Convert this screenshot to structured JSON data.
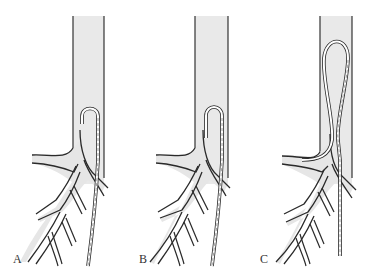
{
  "figure": {
    "colors": {
      "vessel_fill": "#e8e8e8",
      "outline": "#2a2a2a",
      "background": "#ffffff"
    },
    "panels": [
      {
        "id": "A",
        "label": "A",
        "state": "catheter tip forms small hook at vessel origin"
      },
      {
        "id": "B",
        "label": "B",
        "state": "catheter hook advanced, tip directed into branch"
      },
      {
        "id": "C",
        "label": "C",
        "state": "catheter formed into large loop in trunk, tip engaged in side branch"
      }
    ]
  }
}
